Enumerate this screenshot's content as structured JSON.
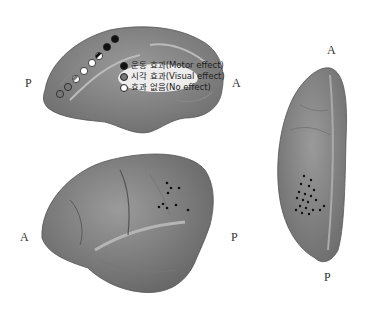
{
  "medial_view": {
    "label_left": "P",
    "label_right": "A",
    "legend": [
      {
        "label": "운동 효과(Motor effect)",
        "color": "#111111"
      },
      {
        "label": "시각 효과(Visual effect)",
        "color": "#777777"
      },
      {
        "label": "효과 없음(No effect)",
        "color": "#ffffff"
      }
    ],
    "electrodes": [
      {
        "x": 115,
        "y": 39,
        "type": "motor"
      },
      {
        "x": 107,
        "y": 47,
        "type": "motor"
      },
      {
        "x": 99,
        "y": 56,
        "type": "mixed"
      },
      {
        "x": 92,
        "y": 63,
        "type": "none"
      },
      {
        "x": 84,
        "y": 71,
        "type": "none"
      },
      {
        "x": 76,
        "y": 79,
        "type": "mixed"
      },
      {
        "x": 68,
        "y": 87,
        "type": "visual"
      },
      {
        "x": 60,
        "y": 94,
        "type": "visual"
      }
    ]
  },
  "lateral_view": {
    "label_left": "A",
    "label_right": "P"
  },
  "dorsal_view": {
    "label_top": "A",
    "label_bottom": "P"
  }
}
